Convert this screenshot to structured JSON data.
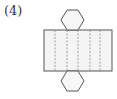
{
  "problem": {
    "label": "(4)",
    "figure": "hexagonal-prism-net",
    "description": "Net of a hexagonal prism: rectangle of 6 lateral faces with a hexagon above and below"
  },
  "colors": {
    "stroke": "#555555",
    "fold": "#888888",
    "fill": "#f4f4f4"
  }
}
